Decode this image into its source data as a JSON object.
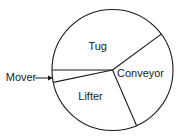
{
  "chart_data": {
    "type": "pie",
    "title": "",
    "categories": [
      "Tug",
      "Mover",
      "Lifter",
      "Conveyor"
    ],
    "values": [
      40,
      3.3,
      28.2,
      28.5
    ],
    "unit": "percent (estimated from slice angles)",
    "slices": [
      {
        "label": "Tug",
        "value": 40,
        "start_deg": 36.4,
        "end_deg": 180,
        "label_pos": [
          97.7,
          47
        ]
      },
      {
        "label": "Mover",
        "value": 3.3,
        "start_deg": 180,
        "end_deg": 191.8,
        "external_label": true,
        "label_pos": [
          21,
          78
        ]
      },
      {
        "label": "Lifter",
        "value": 28.2,
        "start_deg": 191.8,
        "end_deg": 293.4,
        "label_pos": [
          90.5,
          97
        ]
      },
      {
        "label": "Conveyor",
        "value": 28.5,
        "start_deg": 293.4,
        "end_deg": 396.4,
        "label_pos": [
          140.5,
          74
        ]
      }
    ],
    "annotations": [
      {
        "text": "Mover",
        "arrow_from": [
          35,
          78
        ],
        "arrow_to": [
          53,
          78
        ]
      }
    ],
    "legend": "none",
    "grid": false,
    "colors": {
      "stroke": "#1a1a1a",
      "fill": "#ffffff",
      "text": "#1a1a1a"
    },
    "geometry": {
      "cx": 112.5,
      "cy": 70,
      "r": 60.5
    }
  }
}
